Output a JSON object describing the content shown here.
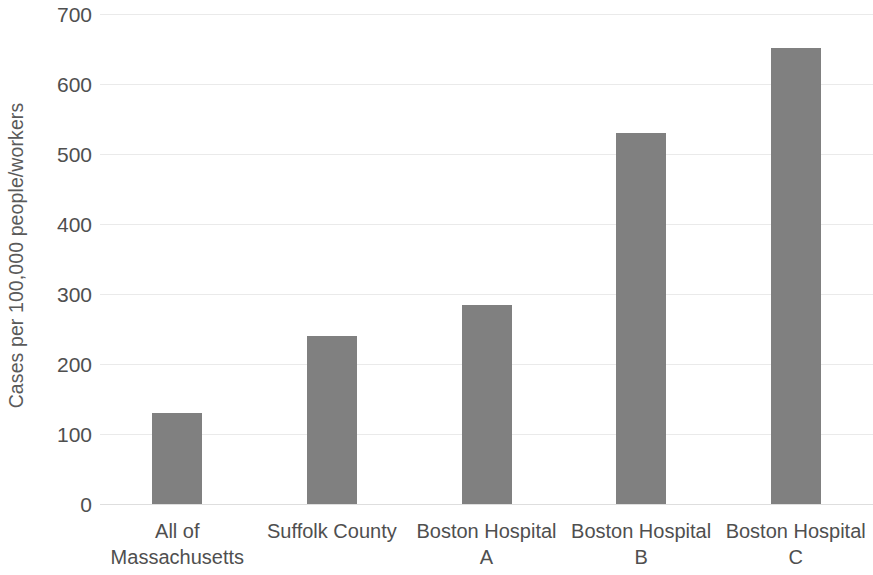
{
  "chart_data": {
    "type": "bar",
    "title": "",
    "subtitle": "",
    "xlabel": "",
    "ylabel": "Cases per 100,000 people/workers",
    "categories": [
      "All of\nMassachusetts",
      "Suffolk County",
      "Boston Hospital\nA",
      "Boston Hospital\nB",
      "Boston Hospital\nC"
    ],
    "values": [
      130,
      240,
      285,
      530,
      652
    ],
    "ylim": [
      0,
      700
    ],
    "ytick_labels": [
      "0",
      "100",
      "200",
      "300",
      "400",
      "500",
      "600",
      "700"
    ],
    "ytick_values": [
      0,
      100,
      200,
      300,
      400,
      500,
      600,
      700
    ],
    "grid": true,
    "grid_axis": "y",
    "legend": false,
    "legend_position": "none",
    "bar_color": "#808080",
    "gridline_color": "#e9e9e9",
    "text_color": "#4f4f4f",
    "background_color": "#ffffff"
  }
}
